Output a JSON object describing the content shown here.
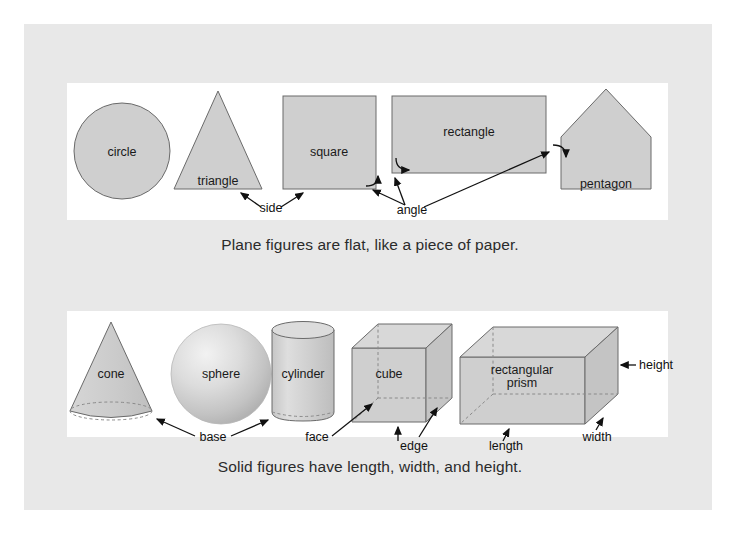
{
  "page": {
    "background": "#ffffff",
    "board_background": "#e8e8e8",
    "panel_background": "#ffffff",
    "shape_fill": "#cfcfcf",
    "shape_stroke": "#555555",
    "text_color": "#1a1a1a"
  },
  "plane_section": {
    "caption": "Plane figures are flat, like a piece of paper.",
    "figures": [
      {
        "name": "circle",
        "label": "circle"
      },
      {
        "name": "triangle",
        "label": "triangle"
      },
      {
        "name": "square",
        "label": "square"
      },
      {
        "name": "rectangle",
        "label": "rectangle"
      },
      {
        "name": "pentagon",
        "label": "pentagon"
      }
    ],
    "annotations": [
      {
        "name": "side",
        "label": "side"
      },
      {
        "name": "angle",
        "label": "angle"
      }
    ]
  },
  "solid_section": {
    "caption": "Solid figures have length, width, and height.",
    "figures": [
      {
        "name": "cone",
        "label": "cone"
      },
      {
        "name": "sphere",
        "label": "sphere"
      },
      {
        "name": "cylinder",
        "label": "cylinder"
      },
      {
        "name": "cube",
        "label": "cube"
      },
      {
        "name": "rectangular-prism",
        "label_line1": "rectangular",
        "label_line2": "prism"
      }
    ],
    "annotations": [
      {
        "name": "base",
        "label": "base"
      },
      {
        "name": "face",
        "label": "face"
      },
      {
        "name": "edge",
        "label": "edge"
      },
      {
        "name": "length",
        "label": "length"
      },
      {
        "name": "width",
        "label": "width"
      },
      {
        "name": "height",
        "label": "height"
      }
    ]
  }
}
